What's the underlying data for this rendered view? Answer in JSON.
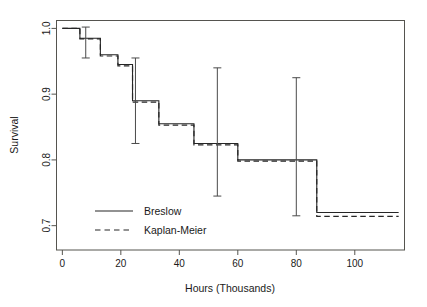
{
  "chart_data": {
    "type": "line",
    "title": "",
    "subtitle": "",
    "xlabel": "Hours (Thousands)",
    "ylabel": "Survival",
    "xlim": [
      -2,
      117
    ],
    "ylim": [
      0.663,
      1.012
    ],
    "xticks": [
      0,
      20,
      40,
      60,
      80,
      100
    ],
    "xticklabels": [
      "0",
      "20",
      "40",
      "60",
      "80",
      "100"
    ],
    "yticks": [
      0.7,
      0.8,
      0.9,
      1.0
    ],
    "yticklabels": [
      "0.7",
      "0.8",
      "0.9",
      "1.0"
    ],
    "grid": false,
    "legend_position": "lower-left-inside",
    "series": [
      {
        "name": "Breslow",
        "style": "solid",
        "color": "#262626",
        "step": "post",
        "x": [
          0,
          6,
          13,
          19,
          24,
          33,
          45,
          60,
          87,
          115
        ],
        "y": [
          1.0,
          0.985,
          0.96,
          0.945,
          0.89,
          0.855,
          0.825,
          0.8,
          0.72,
          0.72
        ]
      },
      {
        "name": "Kaplan-Meier",
        "style": "dashed",
        "color": "#262626",
        "step": "post",
        "x": [
          0,
          6,
          13,
          19,
          24,
          33,
          45,
          60,
          87,
          115
        ],
        "y": [
          1.0,
          0.984,
          0.958,
          0.943,
          0.888,
          0.853,
          0.823,
          0.798,
          0.714,
          0.714
        ]
      }
    ],
    "errorbars": [
      {
        "x": 8,
        "y": 0.985,
        "lower": 0.955,
        "upper": 1.002
      },
      {
        "x": 25,
        "y": 0.89,
        "lower": 0.825,
        "upper": 0.955
      },
      {
        "x": 53,
        "y": 0.825,
        "lower": 0.745,
        "upper": 0.94
      },
      {
        "x": 80,
        "y": 0.8,
        "lower": 0.715,
        "upper": 0.925
      }
    ]
  },
  "legend": {
    "entries": [
      {
        "label": "Breslow",
        "style": "solid"
      },
      {
        "label": "Kaplan-Meier",
        "style": "dashed"
      }
    ]
  },
  "axes": {
    "xlabel": "Hours (Thousands)",
    "ylabel": "Survival"
  }
}
